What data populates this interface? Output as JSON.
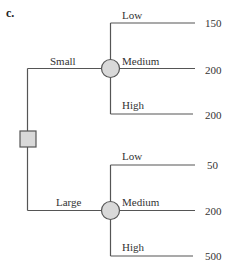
{
  "part_label": "c.",
  "decision_node": {
    "type": "square",
    "fill": "#d9d9d9"
  },
  "branches": [
    {
      "label": "Small",
      "chance_node": {
        "type": "circle",
        "fill": "#d9d9d9"
      },
      "outcomes": [
        {
          "label": "Low",
          "value": "150"
        },
        {
          "label": "Medium",
          "value": "200"
        },
        {
          "label": "High",
          "value": "200"
        }
      ]
    },
    {
      "label": "Large",
      "chance_node": {
        "type": "circle",
        "fill": "#d9d9d9"
      },
      "outcomes": [
        {
          "label": "Low",
          "value": "50"
        },
        {
          "label": "Medium",
          "value": "200"
        },
        {
          "label": "High",
          "value": "500"
        }
      ]
    }
  ],
  "colors": {
    "line": "#555555",
    "node_fill": "#d9d9d9",
    "node_stroke": "#555555"
  }
}
